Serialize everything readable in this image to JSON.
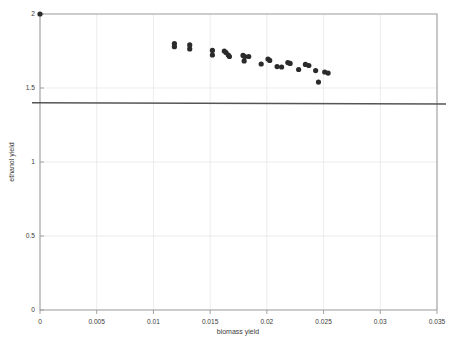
{
  "chart_data": {
    "type": "scatter",
    "title": "",
    "xlabel": "biomass yield",
    "ylabel": "ethanol yield",
    "xlim": [
      0,
      0.035
    ],
    "ylim": [
      0,
      2
    ],
    "xticks": [
      0,
      0.005,
      0.01,
      0.015,
      0.02,
      0.025,
      0.03,
      0.035
    ],
    "xtick_labels": [
      "0",
      "0.005",
      "0.01",
      "0.015",
      "0.02",
      "0.025",
      "0.03",
      "0.035"
    ],
    "yticks": [
      0,
      0.5,
      1,
      1.5,
      2
    ],
    "ytick_labels": [
      "0",
      "0.5",
      "1",
      "1.5",
      "2"
    ],
    "grid": true,
    "legend": "none",
    "point_color": "#2b2b2b",
    "threshold_line": {
      "value": 1.4,
      "color": "#555555",
      "orientation": "horizontal",
      "extends_beyond_axes": true
    },
    "series": [
      {
        "name": "pareto front",
        "points": [
          [
            0.0,
            2.0
          ],
          [
            0.01185,
            1.8
          ],
          [
            0.01185,
            1.779
          ],
          [
            0.0132,
            1.791
          ],
          [
            0.0132,
            1.764
          ],
          [
            0.0152,
            1.754
          ],
          [
            0.0152,
            1.723
          ],
          [
            0.01625,
            1.75
          ],
          [
            0.0164,
            1.74
          ],
          [
            0.0166,
            1.723
          ],
          [
            0.0167,
            1.713
          ],
          [
            0.0179,
            1.72
          ],
          [
            0.01805,
            1.713
          ],
          [
            0.0184,
            1.713
          ],
          [
            0.018,
            1.683
          ],
          [
            0.0195,
            1.662
          ],
          [
            0.0201,
            1.696
          ],
          [
            0.02025,
            1.686
          ],
          [
            0.0209,
            1.645
          ],
          [
            0.0213,
            1.642
          ],
          [
            0.02185,
            1.672
          ],
          [
            0.02205,
            1.666
          ],
          [
            0.0228,
            1.625
          ],
          [
            0.0234,
            1.659
          ],
          [
            0.0237,
            1.652
          ],
          [
            0.0243,
            1.618
          ],
          [
            0.02455,
            1.54
          ],
          [
            0.0251,
            1.608
          ],
          [
            0.0254,
            1.601
          ]
        ]
      }
    ]
  },
  "axes": {
    "x_axis_name": "biomass yield",
    "y_axis_name": "ethanol yield"
  }
}
